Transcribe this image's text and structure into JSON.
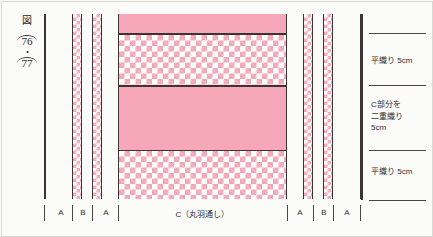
{
  "caption": {
    "figure_mark": "図",
    "page_first": "76",
    "separator": "・",
    "page_second": "77"
  },
  "spine_labels": [
    {
      "id": "plain-weave-top",
      "text": "平織り  5cm"
    },
    {
      "id": "double-weave-c",
      "text": "C部分を\n二重織り\n5cm"
    },
    {
      "id": "plain-weave-bottom",
      "text": "平織り  5cm"
    }
  ],
  "bottom_segments": [
    {
      "id": "left-a1",
      "label": "A"
    },
    {
      "id": "left-b",
      "label": "B"
    },
    {
      "id": "left-a2",
      "label": "A"
    },
    {
      "id": "center-c",
      "label": "C（丸羽通し）"
    },
    {
      "id": "right-a1",
      "label": "A"
    },
    {
      "id": "right-b",
      "label": "B"
    },
    {
      "id": "right-a2",
      "label": "A"
    }
  ],
  "bands": [
    {
      "id": "band-solid-top",
      "style": "solid"
    },
    {
      "id": "band-check-upper",
      "style": "check"
    },
    {
      "id": "band-solid-middle",
      "style": "solid"
    },
    {
      "id": "band-check-lower",
      "style": "check"
    }
  ],
  "colors": {
    "pink_solid": "#f7a8b8",
    "pink_check": "#f2a7b6",
    "ink": "#3b3431",
    "paper": "#fbfbf9"
  }
}
